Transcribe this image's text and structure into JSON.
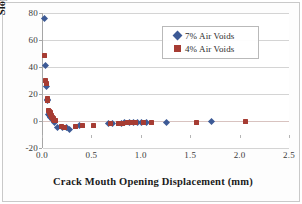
{
  "figure": {
    "border_color": "#c9c9c9",
    "background": "#ffffff"
  },
  "chart_data": {
    "type": "scatter",
    "title": "",
    "subtitle": "",
    "xlabel": "Crack Mouth Opening Displacement (mm)",
    "ylabel": "Slope (ΔkN/Δmm)",
    "xlim": [
      0.0,
      2.5
    ],
    "ylim": [
      -20,
      80
    ],
    "xticks": [
      "0.0",
      "0.5",
      "1.0",
      "1.5",
      "2.0",
      "2.5"
    ],
    "xtick_values": [
      0.0,
      0.5,
      1.0,
      1.5,
      2.0,
      2.5
    ],
    "yticks": [
      "-20",
      "0",
      "20",
      "40",
      "60",
      "80"
    ],
    "ytick_values": [
      -20,
      0,
      20,
      40,
      60,
      80
    ],
    "grid": "horizontal",
    "legend_position": "upper-right-inside",
    "colors": {
      "series_7_percent": "#3d5a96",
      "series_4_percent": "#a63c33",
      "gridline": "#d4d4d4",
      "zero_gridline": "#d8c3c0",
      "axis": "#a6a6a6",
      "text": "#2b2b2b"
    },
    "series": [
      {
        "name": "7% Air Voids",
        "marker": "diamond",
        "color": "#3d5a96",
        "points": [
          [
            0.01,
            76.0
          ],
          [
            0.02,
            41.3
          ],
          [
            0.03,
            25.8
          ],
          [
            0.04,
            15.8
          ],
          [
            0.05,
            15.2
          ],
          [
            0.06,
            5.0
          ],
          [
            0.07,
            4.2
          ],
          [
            0.08,
            3.0
          ],
          [
            0.1,
            1.0
          ],
          [
            0.12,
            -1.0
          ],
          [
            0.15,
            -4.5
          ],
          [
            0.2,
            -4.6
          ],
          [
            0.24,
            -5.0
          ],
          [
            0.27,
            -6.2
          ],
          [
            0.37,
            -3.6
          ],
          [
            0.66,
            -2.0
          ],
          [
            0.7,
            -1.8
          ],
          [
            0.79,
            -1.5
          ],
          [
            0.82,
            -1.4
          ],
          [
            0.88,
            -1.0
          ],
          [
            0.92,
            -1.2
          ],
          [
            0.96,
            -1.0
          ],
          [
            1.0,
            -0.9
          ],
          [
            1.05,
            -0.8
          ],
          [
            1.25,
            -0.9
          ],
          [
            1.7,
            -0.5
          ]
        ]
      },
      {
        "name": "4% Air Voids",
        "marker": "square",
        "color": "#a63c33",
        "points": [
          [
            0.015,
            48.8
          ],
          [
            0.025,
            29.8
          ],
          [
            0.03,
            28.0
          ],
          [
            0.04,
            16.8
          ],
          [
            0.045,
            16.0
          ],
          [
            0.05,
            15.5
          ],
          [
            0.06,
            7.5
          ],
          [
            0.065,
            7.0
          ],
          [
            0.07,
            6.5
          ],
          [
            0.075,
            6.0
          ],
          [
            0.08,
            5.0
          ],
          [
            0.085,
            4.2
          ],
          [
            0.09,
            3.5
          ],
          [
            0.1,
            2.6
          ],
          [
            0.105,
            2.0
          ],
          [
            0.11,
            1.2
          ],
          [
            0.12,
            0.6
          ],
          [
            0.13,
            0.2
          ],
          [
            0.19,
            -4.4
          ],
          [
            0.22,
            -4.6
          ],
          [
            0.33,
            -3.8
          ],
          [
            0.4,
            -3.5
          ],
          [
            0.51,
            -3.0
          ],
          [
            0.68,
            -2.0
          ],
          [
            0.76,
            -1.6
          ],
          [
            0.8,
            -1.5
          ],
          [
            0.85,
            -1.3
          ],
          [
            0.9,
            -1.2
          ],
          [
            0.94,
            -1.1
          ],
          [
            1.02,
            -1.0
          ],
          [
            1.1,
            -1.0
          ],
          [
            1.55,
            -0.8
          ],
          [
            2.05,
            -0.7
          ]
        ]
      }
    ]
  },
  "legend": {
    "entries": [
      {
        "label": "7% Air Voids",
        "marker": "diamond",
        "color": "#3d5a96"
      },
      {
        "label": "4% Air Voids",
        "marker": "square",
        "color": "#a63c33"
      }
    ]
  }
}
